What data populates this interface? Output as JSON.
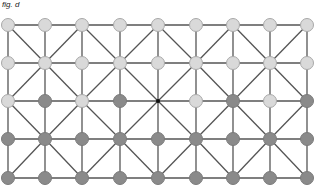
{
  "figure": {
    "label": "fig. d"
  },
  "grid": {
    "columns_x": [
      8,
      45,
      82,
      120,
      158,
      196,
      233,
      270,
      307
    ],
    "rows_y": [
      25,
      63,
      101,
      139,
      178
    ],
    "node_radius": 6.5,
    "nodes": [
      [
        "light",
        "light",
        "light",
        "light",
        "light",
        "light",
        "light",
        "light",
        "light"
      ],
      [
        "light",
        "light",
        "light",
        "light",
        "light",
        "light",
        "light",
        "light",
        "light"
      ],
      [
        "light",
        "dark",
        "light",
        "dark",
        "empty",
        "light",
        "dark",
        "light",
        "dark"
      ],
      [
        "dark",
        "dark",
        "dark",
        "dark",
        "dark",
        "dark",
        "dark",
        "dark",
        "dark"
      ],
      [
        "dark",
        "dark",
        "dark",
        "dark",
        "dark",
        "dark",
        "dark",
        "dark",
        "dark"
      ]
    ],
    "diagonal_rule": "diagonals connect hub nodes: even columns on rows 1,3,5 and odd columns on rows 2,4 to their diagonal neighbours"
  },
  "colors": {
    "line": "#555555",
    "light_fill": "#d9d9d9",
    "light_stroke": "#a8a8a8",
    "dark_fill": "#8a8a8a",
    "dark_stroke": "#7a7a7a",
    "empty_dot": "#111111"
  }
}
